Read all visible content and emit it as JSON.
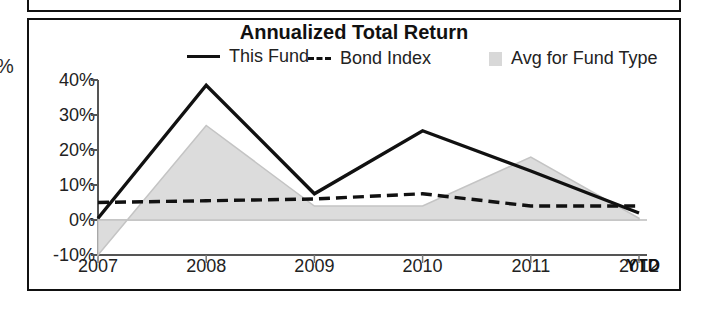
{
  "panel": {
    "title": "Annualized Total Return",
    "cropped_left_unit": "%"
  },
  "legend": {
    "items": [
      {
        "label": "This Fund",
        "marker": "solid-line",
        "color": "#111111"
      },
      {
        "label": "Bond Index",
        "marker": "dashed-line",
        "color": "#111111"
      },
      {
        "label": "Avg for Fund Type",
        "marker": "filled-area",
        "color": "#d8d8d8"
      }
    ]
  },
  "axis": {
    "y_ticks": [
      "40%",
      "30%",
      "20%",
      "10%",
      "0%",
      "-10%"
    ],
    "x_ticks": [
      "2007",
      "2008",
      "2009",
      "2010",
      "2011",
      "2012"
    ],
    "x_suffix": "YTD"
  },
  "chart_data": {
    "type": "line",
    "title": "Annualized Total Return",
    "xlabel": "",
    "ylabel": "%",
    "categories": [
      "2007",
      "2008",
      "2009",
      "2010",
      "2011",
      "2012"
    ],
    "x_tick_labels": [
      "2007",
      "2008",
      "2009",
      "2010",
      "2011",
      "2012"
    ],
    "x_axis_note": "YTD",
    "y_tick_labels": [
      "-10%",
      "0%",
      "10%",
      "20%",
      "30%",
      "40%"
    ],
    "ylim": [
      -10,
      40
    ],
    "y_unit": "percent",
    "grid": false,
    "legend_position": "top",
    "series": [
      {
        "name": "This Fund",
        "type": "line",
        "style": "solid",
        "color": "#111111",
        "values": [
          0.5,
          38.5,
          7.5,
          25.5,
          14.0,
          2.0
        ]
      },
      {
        "name": "Bond Index",
        "type": "line",
        "style": "dashed",
        "color": "#111111",
        "values": [
          5.0,
          5.5,
          6.0,
          7.5,
          4.0,
          4.0
        ]
      },
      {
        "name": "Avg for Fund Type",
        "type": "area",
        "style": "filled",
        "color": "#d8d8d8",
        "values": [
          -10.0,
          27.0,
          4.0,
          4.0,
          18.0,
          0.5
        ]
      }
    ]
  }
}
